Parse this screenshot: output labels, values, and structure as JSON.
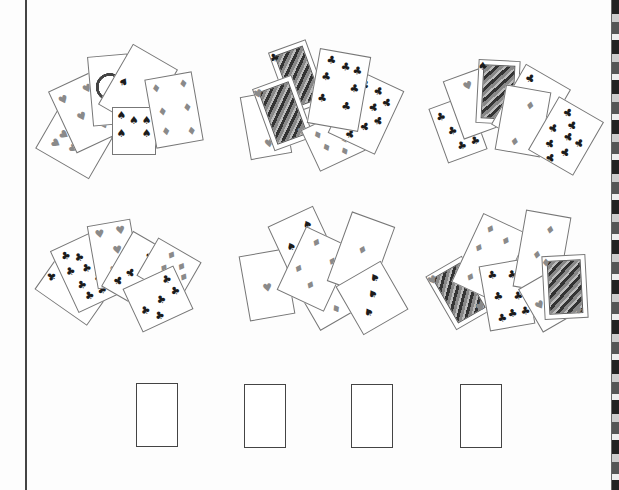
{
  "worksheet": {
    "answer_boxes": [
      {
        "x": 136,
        "y": 383
      },
      {
        "x": 244,
        "y": 384
      },
      {
        "x": 351,
        "y": 384
      },
      {
        "x": 460,
        "y": 384
      }
    ],
    "groups": [
      {
        "name": "group-1",
        "cards": [
          {
            "x": 50,
            "y": 112,
            "w": 48,
            "h": 62,
            "rot": -60,
            "suit": "heart",
            "color": "red",
            "pips": [
              [
                30,
                25
              ],
              [
                55,
                30
              ],
              [
                40,
                55
              ],
              [
                70,
                55
              ]
            ]
          },
          {
            "x": 60,
            "y": 78,
            "w": 50,
            "h": 68,
            "rot": -25,
            "suit": "heart",
            "color": "red",
            "pips": [
              [
                20,
                20
              ],
              [
                75,
                20
              ],
              [
                40,
                55
              ],
              [
                75,
                80
              ]
            ]
          },
          {
            "x": 90,
            "y": 55,
            "w": 40,
            "h": 70,
            "rot": -5,
            "face": "emblem"
          },
          {
            "x": 112,
            "y": 52,
            "w": 52,
            "h": 70,
            "rot": 30,
            "suit": "spade",
            "color": "black",
            "pips": [
              [
                20,
                55
              ]
            ]
          },
          {
            "x": 112,
            "y": 107,
            "w": 44,
            "h": 48,
            "rot": 0,
            "suit": "spade",
            "color": "black",
            "pips": [
              [
                20,
                15
              ],
              [
                50,
                25
              ],
              [
                80,
                25
              ],
              [
                20,
                55
              ],
              [
                80,
                55
              ]
            ]
          },
          {
            "x": 150,
            "y": 75,
            "w": 48,
            "h": 70,
            "rot": -10,
            "suit": "diamond",
            "color": "red",
            "pips": [
              [
                20,
                15
              ],
              [
                80,
                15
              ],
              [
                25,
                50
              ],
              [
                80,
                50
              ],
              [
                25,
                80
              ],
              [
                80,
                85
              ]
            ]
          }
        ]
      },
      {
        "name": "group-2",
        "cards": [
          {
            "x": 245,
            "y": 93,
            "w": 42,
            "h": 64,
            "rot": -10,
            "suit": "heart",
            "color": "red",
            "pips": [
              [
                50,
                80
              ]
            ]
          },
          {
            "x": 278,
            "y": 44,
            "w": 40,
            "h": 66,
            "rot": -20,
            "face": "portrait",
            "suit": "club",
            "color": "black"
          },
          {
            "x": 262,
            "y": 80,
            "w": 42,
            "h": 66,
            "rot": -20,
            "face": "portrait",
            "suit": "heart",
            "color": "red"
          },
          {
            "x": 308,
            "y": 117,
            "w": 52,
            "h": 46,
            "rot": -25,
            "suit": "diamond",
            "color": "red",
            "pips": [
              [
                25,
                25
              ],
              [
                60,
                25
              ],
              [
                30,
                60
              ],
              [
                70,
                60
              ],
              [
                60,
                85
              ]
            ]
          },
          {
            "x": 340,
            "y": 77,
            "w": 52,
            "h": 70,
            "rot": 25,
            "suit": "club",
            "color": "black",
            "pips": [
              [
                25,
                15
              ],
              [
                55,
                15
              ],
              [
                80,
                25
              ],
              [
                25,
                40
              ],
              [
                60,
                40
              ],
              [
                80,
                55
              ],
              [
                25,
                70
              ],
              [
                60,
                70
              ],
              [
                40,
                90
              ]
            ]
          },
          {
            "x": 313,
            "y": 52,
            "w": 52,
            "h": 76,
            "rot": 10,
            "suit": "club",
            "color": "black",
            "pips": [
              [
                25,
                12
              ],
              [
                55,
                18
              ],
              [
                80,
                20
              ],
              [
                20,
                35
              ],
              [
                80,
                45
              ],
              [
                20,
                65
              ],
              [
                70,
                70
              ]
            ]
          }
        ]
      },
      {
        "name": "group-3",
        "cards": [
          {
            "x": 437,
            "y": 100,
            "w": 42,
            "h": 58,
            "rot": -20,
            "suit": "club",
            "color": "black",
            "pips": [
              [
                20,
                20
              ],
              [
                35,
                50
              ],
              [
                45,
                80
              ],
              [
                80,
                80
              ]
            ]
          },
          {
            "x": 452,
            "y": 72,
            "w": 44,
            "h": 62,
            "rot": -20,
            "suit": "heart",
            "color": "red",
            "pips": [
              [
                50,
                20
              ]
            ]
          },
          {
            "x": 477,
            "y": 60,
            "w": 42,
            "h": 64,
            "rot": 3,
            "face": "portrait",
            "suit": "spade",
            "color": "black"
          },
          {
            "x": 505,
            "y": 72,
            "w": 52,
            "h": 70,
            "rot": 30,
            "suit": "club",
            "color": "black",
            "pips": [
              [
                20,
                15
              ],
              [
                70,
                35
              ],
              [
                20,
                60
              ]
            ]
          },
          {
            "x": 500,
            "y": 88,
            "w": 46,
            "h": 66,
            "rot": 10,
            "suit": "diamond",
            "color": "red",
            "pips": [
              [
                60,
                25
              ],
              [
                40,
                85
              ]
            ]
          },
          {
            "x": 540,
            "y": 105,
            "w": 52,
            "h": 62,
            "rot": 30,
            "suit": "club",
            "color": "black",
            "pips": [
              [
                30,
                15
              ],
              [
                50,
                30
              ],
              [
                20,
                50
              ],
              [
                55,
                50
              ],
              [
                80,
                50
              ],
              [
                30,
                75
              ],
              [
                65,
                75
              ],
              [
                45,
                95
              ]
            ]
          }
        ]
      },
      {
        "name": "group-4",
        "cards": [
          {
            "x": 50,
            "y": 255,
            "w": 50,
            "h": 64,
            "rot": -55,
            "suit": "club",
            "color": "black",
            "pips": [
              [
                40,
                10
              ]
            ]
          },
          {
            "x": 62,
            "y": 238,
            "w": 48,
            "h": 68,
            "rot": -25,
            "suit": "club",
            "color": "black",
            "pips": [
              [
                25,
                15
              ],
              [
                50,
                25
              ],
              [
                20,
                40
              ],
              [
                55,
                45
              ],
              [
                30,
                65
              ],
              [
                70,
                65
              ],
              [
                35,
                85
              ],
              [
                65,
                85
              ]
            ]
          },
          {
            "x": 92,
            "y": 222,
            "w": 44,
            "h": 64,
            "rot": -10,
            "suit": "heart",
            "color": "red",
            "pips": [
              [
                25,
                15
              ],
              [
                75,
                15
              ],
              [
                60,
                45
              ],
              [
                45,
                75
              ]
            ]
          },
          {
            "x": 114,
            "y": 238,
            "w": 46,
            "h": 64,
            "rot": 30,
            "suit": "club",
            "color": "black",
            "pips": [
              [
                60,
                20
              ],
              [
                40,
                60
              ],
              [
                25,
                80
              ]
            ]
          },
          {
            "x": 144,
            "y": 247,
            "w": 50,
            "h": 44,
            "rot": 30,
            "suit": "diamond",
            "color": "red",
            "pips": [
              [
                40,
                20
              ],
              [
                70,
                30
              ],
              [
                40,
                55
              ],
              [
                85,
                50
              ]
            ]
          },
          {
            "x": 130,
            "y": 275,
            "w": 56,
            "h": 48,
            "rot": -25,
            "suit": "club",
            "color": "black",
            "pips": [
              [
                80,
                20
              ],
              [
                20,
                60
              ],
              [
                55,
                55
              ],
              [
                85,
                50
              ],
              [
                40,
                85
              ]
            ]
          }
        ]
      },
      {
        "name": "group-5",
        "cards": [
          {
            "x": 244,
            "y": 252,
            "w": 46,
            "h": 66,
            "rot": -10,
            "suit": "heart",
            "color": "red",
            "pips": [
              [
                50,
                55
              ]
            ]
          },
          {
            "x": 280,
            "y": 213,
            "w": 50,
            "h": 70,
            "rot": -25,
            "suit": "spade",
            "color": "black",
            "pips": [
              [
                25,
                40
              ],
              [
                75,
                20
              ]
            ]
          },
          {
            "x": 300,
            "y": 255,
            "w": 50,
            "h": 68,
            "rot": -30,
            "suit": "diamond",
            "color": "red",
            "pips": [
              [
                65,
                45
              ],
              [
                50,
                85
              ]
            ]
          },
          {
            "x": 289,
            "y": 234,
            "w": 52,
            "h": 70,
            "rot": 25,
            "suit": "diamond",
            "color": "red",
            "pips": [
              [
                30,
                15
              ],
              [
                75,
                30
              ],
              [
                20,
                60
              ],
              [
                55,
                75
              ]
            ]
          },
          {
            "x": 338,
            "y": 217,
            "w": 46,
            "h": 74,
            "rot": 20,
            "suit": "diamond",
            "color": "red",
            "pips": [
              [
                50,
                45
              ]
            ]
          },
          {
            "x": 346,
            "y": 270,
            "w": 52,
            "h": 56,
            "rot": -30,
            "suit": "spade",
            "color": "black",
            "pips": [
              [
                75,
                20
              ],
              [
                55,
                45
              ],
              [
                30,
                70
              ]
            ]
          }
        ]
      },
      {
        "name": "group-6",
        "cards": [
          {
            "x": 438,
            "y": 262,
            "w": 42,
            "h": 62,
            "rot": -30,
            "face": "portrait",
            "suit": "heart",
            "color": "red"
          },
          {
            "x": 465,
            "y": 220,
            "w": 50,
            "h": 76,
            "rot": 25,
            "suit": "diamond",
            "color": "red",
            "pips": [
              [
                25,
                15
              ],
              [
                65,
                20
              ],
              [
                20,
                45
              ],
              [
                45,
                70
              ],
              [
                30,
                85
              ]
            ]
          },
          {
            "x": 484,
            "y": 262,
            "w": 46,
            "h": 66,
            "rot": -10,
            "suit": "club",
            "color": "black",
            "pips": [
              [
                25,
                15
              ],
              [
                70,
                20
              ],
              [
                30,
                50
              ],
              [
                75,
                55
              ],
              [
                30,
                85
              ],
              [
                55,
                80
              ],
              [
                85,
                80
              ]
            ]
          },
          {
            "x": 519,
            "y": 213,
            "w": 46,
            "h": 78,
            "rot": 10,
            "suit": "diamond",
            "color": "red",
            "pips": [
              [
                60,
                20
              ],
              [
                40,
                55
              ]
            ]
          },
          {
            "x": 527,
            "y": 273,
            "w": 52,
            "h": 50,
            "rot": -30,
            "suit": "heart",
            "color": "red",
            "pips": [
              [
                20,
                50
              ]
            ]
          },
          {
            "x": 543,
            "y": 255,
            "w": 44,
            "h": 64,
            "rot": -3,
            "face": "portrait",
            "suit": "diamond",
            "color": "red"
          }
        ]
      }
    ],
    "suit_glyphs": {
      "heart": "♥",
      "diamond": "♦",
      "club": "♣",
      "spade": "♠"
    },
    "colors": {
      "red_pip": "#8a8a8a",
      "black_pip": "#1c1c1c",
      "card_border": "#777777",
      "rule": "#444444"
    }
  }
}
